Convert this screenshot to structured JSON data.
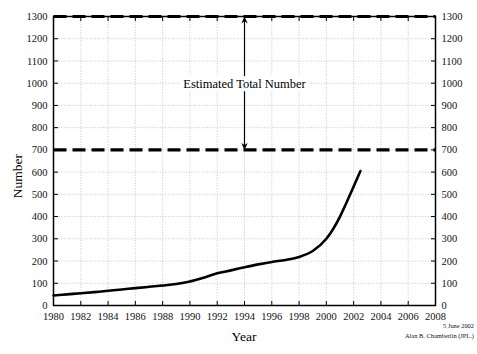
{
  "chart_data": {
    "type": "line",
    "title": "",
    "xlabel": "Year",
    "ylabel": "Number",
    "xlim": [
      1980,
      2008
    ],
    "ylim": [
      0,
      1300
    ],
    "xticks": [
      1980,
      1982,
      1984,
      1986,
      1988,
      1990,
      1992,
      1994,
      1996,
      1998,
      2000,
      2002,
      2004,
      2006,
      2008
    ],
    "yticks": [
      0,
      100,
      200,
      300,
      400,
      500,
      600,
      700,
      800,
      900,
      1000,
      1100,
      1200,
      1300
    ],
    "xtick_labels": [
      "1980",
      "1982",
      "1984",
      "1986",
      "1988",
      "1990",
      "1992",
      "1994",
      "1996",
      "1998",
      "2000",
      "2002",
      "2004",
      "2006",
      "2008"
    ],
    "ytick_labels_left": [
      "0",
      "100",
      "200",
      "300",
      "400",
      "500",
      "600",
      "700",
      "800",
      "900",
      "1000",
      "1100",
      "1200",
      "1300"
    ],
    "ytick_labels_right": [
      "0",
      "100",
      "200",
      "300",
      "400",
      "500",
      "600",
      "700",
      "800",
      "900",
      "1000",
      "1100",
      "1200",
      "1300"
    ],
    "grid": true,
    "legend": "none",
    "axis_mirrored_right": true,
    "series": [
      {
        "name": "Known number",
        "style": "solid",
        "color": "#000000",
        "x": [
          1980,
          1981,
          1982,
          1983,
          1984,
          1985,
          1986,
          1987,
          1988,
          1989,
          1990,
          1991,
          1992,
          1993,
          1994,
          1995,
          1996,
          1997,
          1998,
          1999,
          2000,
          2001,
          2002.5
        ],
        "values": [
          45,
          50,
          55,
          60,
          66,
          72,
          78,
          84,
          90,
          97,
          108,
          125,
          145,
          158,
          172,
          185,
          196,
          205,
          218,
          245,
          300,
          400,
          605
        ]
      }
    ],
    "reference_lines": [
      {
        "name": "lower-estimate",
        "y": 700,
        "style": "dashed",
        "color": "#000000"
      },
      {
        "name": "upper-estimate",
        "y": 1300,
        "style": "dashed",
        "color": "#000000"
      }
    ],
    "annotations": [
      {
        "name": "estimated-total-number",
        "text": "Estimated Total Number",
        "arrow": "double",
        "x": 1994,
        "y_from": 700,
        "y_to": 1300
      }
    ]
  },
  "credit": {
    "date": "5 June 2002",
    "author": "Alan B. Chamberlin (JPL.)"
  },
  "colors": {
    "curve": "#000000",
    "axis": "#000000",
    "grid": "#b9b9b9",
    "background": "#ffffff"
  }
}
